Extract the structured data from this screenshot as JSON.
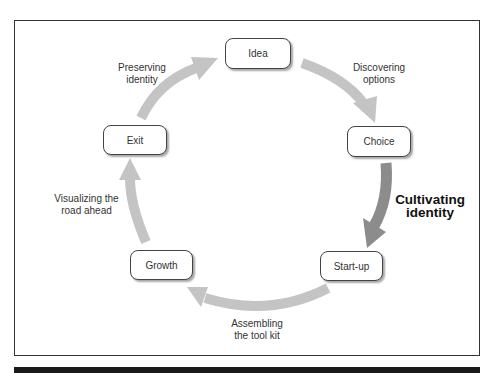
{
  "diagram": {
    "type": "cycle",
    "nodes": [
      {
        "id": "idea",
        "label": "Idea"
      },
      {
        "id": "choice",
        "label": "Choice"
      },
      {
        "id": "startup",
        "label": "Start-up"
      },
      {
        "id": "growth",
        "label": "Growth"
      },
      {
        "id": "exit",
        "label": "Exit"
      }
    ],
    "transitions": [
      {
        "from": "idea",
        "to": "choice",
        "label_line1": "Discovering",
        "label_line2": "options",
        "emphasized": false
      },
      {
        "from": "choice",
        "to": "startup",
        "label_line1": "Cultivating",
        "label_line2": "identity",
        "emphasized": true
      },
      {
        "from": "startup",
        "to": "growth",
        "label_line1": "Assembling",
        "label_line2": "the tool kit",
        "emphasized": false
      },
      {
        "from": "growth",
        "to": "exit",
        "label_line1": "Visualizing the",
        "label_line2": "road ahead",
        "emphasized": false
      },
      {
        "from": "exit",
        "to": "idea",
        "label_line1": "Preserving",
        "label_line2": "identity",
        "emphasized": false
      }
    ],
    "colors": {
      "arrow": "#c4c4c4",
      "arrow_emphasized": "#8c8c8c",
      "border": "#333333"
    }
  }
}
